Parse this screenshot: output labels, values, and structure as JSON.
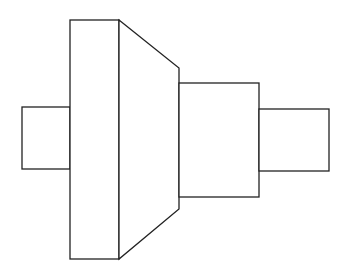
{
  "diagram": {
    "canvas": {
      "width": 349,
      "height": 271,
      "background": "#ffffff"
    },
    "stroke_color": "#222222",
    "fill_color": "#ffffff",
    "shapes": [
      {
        "id": "left-stub",
        "type": "rect",
        "x": 22,
        "y": 107,
        "width": 48,
        "height": 62
      },
      {
        "id": "collar",
        "type": "rect",
        "x": 70,
        "y": 20,
        "width": 49,
        "height": 239
      },
      {
        "id": "taper",
        "type": "polygon",
        "points": [
          [
            119,
            20
          ],
          [
            179,
            68
          ],
          [
            179,
            209
          ],
          [
            119,
            259
          ]
        ]
      },
      {
        "id": "middle-section",
        "type": "rect",
        "x": 179,
        "y": 83,
        "width": 80,
        "height": 114
      },
      {
        "id": "right-stub",
        "type": "rect",
        "x": 259,
        "y": 109,
        "width": 70,
        "height": 62
      }
    ]
  }
}
